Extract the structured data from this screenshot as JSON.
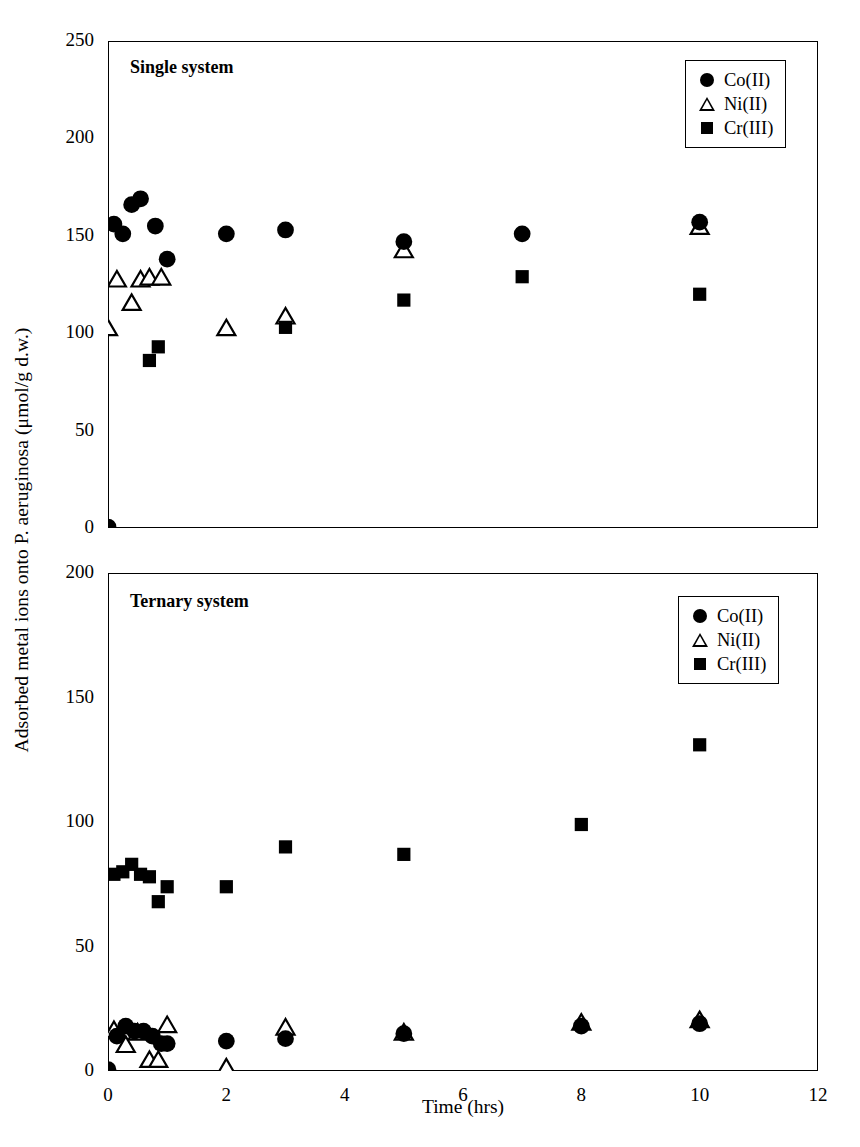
{
  "figure": {
    "xlabel": "Time (hrs)",
    "ylabel": "Adsorbed metal ions onto P. aeruginosa (μmol/g d.w.)",
    "series_color": "#000000"
  },
  "legend": {
    "items": [
      {
        "label": "Co(II)",
        "marker": "filled-circle"
      },
      {
        "label": "Ni(II)",
        "marker": "open-triangle"
      },
      {
        "label": "Cr(III)",
        "marker": "filled-square"
      }
    ]
  },
  "panels": [
    {
      "id": "single",
      "title": "Single system",
      "ylim": [
        0,
        250
      ],
      "yticks": [
        "0",
        "50",
        "100",
        "150",
        "200",
        "250"
      ],
      "xlim": [
        0,
        12
      ],
      "xticks": [
        "0",
        "2",
        "4",
        "6",
        "8",
        "10",
        "12"
      ]
    },
    {
      "id": "ternary",
      "title": "Ternary system",
      "ylim": [
        0,
        200
      ],
      "yticks": [
        "0",
        "50",
        "100",
        "150",
        "200"
      ],
      "xlim": [
        0,
        12
      ],
      "xticks": [
        "0",
        "2",
        "4",
        "6",
        "8",
        "10",
        "12"
      ]
    }
  ],
  "chart_data": [
    {
      "type": "scatter",
      "title": "Single system",
      "xlabel": "Time (hrs)",
      "ylabel": "Adsorbed metal ions onto P. aeruginosa (μmol/g d.w.)",
      "xlim": [
        0,
        12
      ],
      "ylim": [
        0,
        250
      ],
      "xticks": [
        0,
        2,
        4,
        6,
        8,
        10,
        12
      ],
      "yticks": [
        0,
        50,
        100,
        150,
        200,
        250
      ],
      "grid": false,
      "legend_position": "top-right",
      "series": [
        {
          "name": "Co(II)",
          "marker": "filled-circle",
          "points": [
            [
              0.0,
              0.5
            ],
            [
              0.1,
              156
            ],
            [
              0.25,
              151
            ],
            [
              0.4,
              166
            ],
            [
              0.55,
              169
            ],
            [
              0.8,
              155
            ],
            [
              1.0,
              138
            ],
            [
              2.0,
              151
            ],
            [
              3.0,
              153
            ],
            [
              5.0,
              147
            ],
            [
              7.0,
              151
            ],
            [
              10.0,
              157
            ]
          ]
        },
        {
          "name": "Ni(II)",
          "marker": "open-triangle",
          "points": [
            [
              0.0,
              102
            ],
            [
              0.15,
              127
            ],
            [
              0.4,
              115
            ],
            [
              0.55,
              127
            ],
            [
              0.7,
              128
            ],
            [
              0.9,
              128
            ],
            [
              2.0,
              102
            ],
            [
              3.0,
              108
            ],
            [
              5.0,
              142
            ],
            [
              10.0,
              154
            ]
          ]
        },
        {
          "name": "Cr(III)",
          "marker": "filled-square",
          "points": [
            [
              0.7,
              86
            ],
            [
              0.85,
              93
            ],
            [
              3.0,
              103
            ],
            [
              5.0,
              117
            ],
            [
              7.0,
              129
            ],
            [
              10.0,
              120
            ]
          ]
        }
      ]
    },
    {
      "type": "scatter",
      "title": "Ternary system",
      "xlabel": "Time (hrs)",
      "ylabel": "Adsorbed metal ions onto P. aeruginosa (μmol/g d.w.)",
      "xlim": [
        0,
        12
      ],
      "ylim": [
        0,
        200
      ],
      "xticks": [
        0,
        2,
        4,
        6,
        8,
        10,
        12
      ],
      "yticks": [
        0,
        50,
        100,
        150,
        200
      ],
      "grid": false,
      "legend_position": "top-right",
      "series": [
        {
          "name": "Co(II)",
          "marker": "filled-circle",
          "points": [
            [
              0.0,
              0.5
            ],
            [
              0.15,
              14
            ],
            [
              0.3,
              18
            ],
            [
              0.45,
              16
            ],
            [
              0.6,
              16
            ],
            [
              0.75,
              14
            ],
            [
              0.9,
              11
            ],
            [
              1.0,
              11
            ],
            [
              2.0,
              12
            ],
            [
              3.0,
              13
            ],
            [
              5.0,
              15
            ],
            [
              8.0,
              18
            ],
            [
              10.0,
              19
            ]
          ]
        },
        {
          "name": "Ni(II)",
          "marker": "open-triangle",
          "points": [
            [
              0.1,
              16
            ],
            [
              0.3,
              10
            ],
            [
              0.5,
              15
            ],
            [
              0.7,
              4
            ],
            [
              0.85,
              4
            ],
            [
              1.0,
              18
            ],
            [
              2.0,
              1
            ],
            [
              3.0,
              17
            ],
            [
              5.0,
              15
            ],
            [
              8.0,
              19
            ],
            [
              10.0,
              20
            ]
          ]
        },
        {
          "name": "Cr(III)",
          "marker": "filled-square",
          "points": [
            [
              0.1,
              79
            ],
            [
              0.25,
              80
            ],
            [
              0.4,
              83
            ],
            [
              0.55,
              79
            ],
            [
              0.7,
              78
            ],
            [
              0.85,
              68
            ],
            [
              1.0,
              74
            ],
            [
              2.0,
              74
            ],
            [
              3.0,
              90
            ],
            [
              5.0,
              87
            ],
            [
              8.0,
              99
            ],
            [
              10.0,
              131
            ]
          ]
        }
      ]
    }
  ]
}
